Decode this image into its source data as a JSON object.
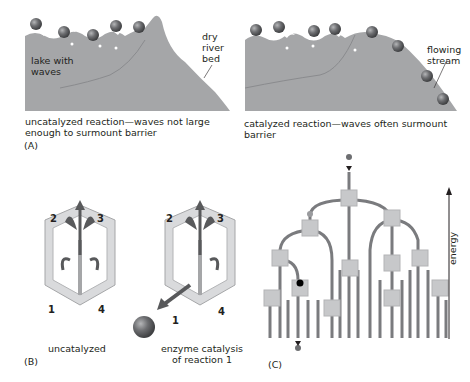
{
  "panel_a": {
    "letter": "(A)",
    "left": {
      "lake_label_1": "lake with",
      "lake_label_2": "waves",
      "riverbed_label_1": "dry",
      "riverbed_label_2": "river",
      "riverbed_label_3": "bed",
      "caption_1": "uncatalyzed reaction—waves not large",
      "caption_2": "enough to surmount barrier"
    },
    "right": {
      "stream_label_1": "flowing",
      "stream_label_2": "stream",
      "caption": "catalyzed reaction—waves often surmount barrier"
    }
  },
  "panel_b": {
    "letter": "(B)",
    "left": {
      "numbers": [
        "2",
        "3",
        "1",
        "4"
      ],
      "caption": "uncatalyzed"
    },
    "right": {
      "numbers": [
        "2",
        "3",
        "1",
        "4"
      ],
      "caption_1": "enzyme catalysis",
      "caption_2": "of reaction 1"
    }
  },
  "panel_c": {
    "letter": "(C)",
    "axis_label": "energy"
  },
  "colors": {
    "terrain": "#a5a6a8",
    "terrain_line": "#7f8083",
    "ball": "#6d6e71",
    "tube": "#7a7b7e",
    "cube": "#c7c8ca",
    "box_face": "#d9dadc",
    "arrow": "#58595b",
    "text": "#231f20"
  }
}
